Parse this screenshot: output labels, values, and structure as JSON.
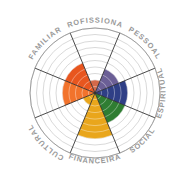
{
  "diagram": {
    "center": {
      "x": 95,
      "y": 93
    },
    "outer_radius": 65,
    "ring_count": 10,
    "background_color": "#ffffff",
    "grid_color": "#b9b9b9",
    "spoke_color": "#2b2b2b"
  },
  "chart_data": {
    "type": "pie",
    "scale_min": 0,
    "scale_max": 10,
    "grid": true,
    "legend_position": "around",
    "categories": [
      "FAMILIAR",
      "PROFISSIONAL",
      "PESSOAL",
      "ESPIRITUAL",
      "SOCIAL",
      "FINANCEIRA",
      "CULTURAL"
    ],
    "values": [
      5,
      2,
      4,
      5,
      5,
      7,
      2
    ],
    "xlabel": "",
    "ylabel": ""
  },
  "sectors": [
    {
      "id": "familiar",
      "label": "FAMILIAR",
      "label_color": "#e8633a",
      "fill_color": "#e8561f",
      "value": 5,
      "start_angle": -67.5,
      "end_angle": -22.5,
      "label_angle": -45,
      "flip": false
    },
    {
      "id": "profissional",
      "label": "PROFISSIONAL",
      "label_color": "#cf93a6",
      "fill_color": "#d4694a",
      "value": 2,
      "start_angle": -22.5,
      "end_angle": 22.5,
      "label_angle": 0,
      "flip": false
    },
    {
      "id": "pessoal",
      "label": "PESSOAL",
      "label_color": "#a59ec9",
      "fill_color": "#6b5f96",
      "value": 4,
      "start_angle": 22.5,
      "end_angle": 67.5,
      "label_angle": 45,
      "flip": false
    },
    {
      "id": "espiritual",
      "label": "ESPIRITUAL",
      "label_color": "#8f90c4",
      "fill_color": "#2f3f86",
      "value": 5,
      "start_angle": 67.5,
      "end_angle": 112.5,
      "label_angle": 90,
      "flip": true
    },
    {
      "id": "social",
      "label": "SOCIAL",
      "label_color": "#7cbf6a",
      "fill_color": "#2f7d32",
      "value": 5,
      "start_angle": 112.5,
      "end_angle": 157.5,
      "label_angle": 135,
      "flip": true
    },
    {
      "id": "financeira",
      "label": "FINANCEIRA",
      "label_color": "#e0c437",
      "fill_color": "#e9a61c",
      "value": 7,
      "start_angle": 157.5,
      "end_angle": 202.5,
      "label_angle": 180,
      "flip": true
    },
    {
      "id": "cultural",
      "label": "CULTURAL",
      "label_color": "#f0a95e",
      "fill_color": "#e9a61c",
      "value": 2,
      "start_angle": 202.5,
      "end_angle": 247.5,
      "label_angle": 225,
      "flip": false
    },
    {
      "id": "familiar-left",
      "label": "",
      "label_color": "#e8633a",
      "fill_color": "#f2732c",
      "value": 5,
      "start_angle": 247.5,
      "end_angle": 292.5,
      "label_angle": 270,
      "flip": false
    }
  ]
}
